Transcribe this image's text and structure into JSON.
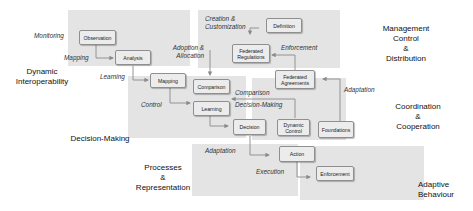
{
  "regions": {
    "dynamic_interoperability": "Dynamic\nInteroperability",
    "management": "Management\nControl\n&\nDistribution",
    "coordination": "Coordination\n&\nCooperation",
    "decision_making": "Decision-Making",
    "processes": "Processes\n&\nRepresentation",
    "adaptive_behaviour": "Adaptive\nBehaviour"
  },
  "nodes": {
    "observation": "Observation",
    "analysis": "Analysis",
    "mapping": "Mapping",
    "comparison": "Comparison",
    "learning": "Learning",
    "decision": "Decision",
    "dynamic_control": "Dynamic Control",
    "foundations": "Foundations",
    "federated_agreements": "Federated Agreements",
    "federated_regulations": "Federated Regulations",
    "definition": "Definition",
    "action": "Action",
    "enforcement": "Enforcement"
  },
  "edge_labels": {
    "monitoring": "Monitoring",
    "mapping": "Mapping",
    "learning": "Learning",
    "adoption_allocation": "Adoption &\nAllocation",
    "creation_customization": "Creation &\nCustomization",
    "enforcement": "Enforcement",
    "adaptation_coord": "Adaptation",
    "comparison": "Comparison",
    "decision_making": "Decision-Making",
    "control": "Control",
    "adaptation_proc": "Adaptation",
    "execution": "Execution"
  },
  "colors": {
    "panel": "#e4e4e4",
    "node_fill": "#ececec",
    "node_border": "#8f8f8f",
    "wire": "#8a8a8a"
  }
}
